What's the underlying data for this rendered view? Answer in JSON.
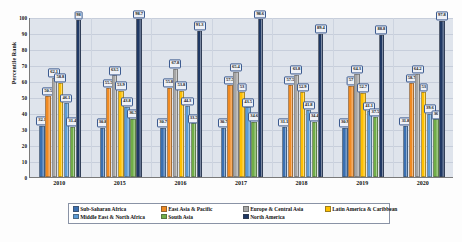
{
  "chart_data": {
    "type": "bar",
    "title": "",
    "xlabel": "",
    "ylabel": "Percentile Rank",
    "ylim": [
      0,
      100
    ],
    "ytick_values": [
      0,
      10,
      20,
      30,
      40,
      50,
      60,
      70,
      80,
      90,
      100
    ],
    "grid": true,
    "legend_position": "bottom",
    "categories": [
      "2010",
      "2015",
      "2016",
      "2017",
      "2018",
      "2019",
      "2020"
    ],
    "series": [
      {
        "name": "Sub-Saharan Africa",
        "color": "#3a6fb0",
        "values": [
          32.1,
          30.8,
          30.7,
          30.7,
          31.1,
          30.9,
          31.8
        ]
      },
      {
        "name": "East Asia & Pacific",
        "color": "#f08a22",
        "values": [
          50.5,
          55.5,
          55.8,
          57.5,
          57.5,
          57.0,
          58.7
        ]
      },
      {
        "name": "Europe & Central Asia",
        "color": "#a6a6a6",
        "values": [
          62.1,
          63.5,
          67.8,
          65.4,
          63.8,
          64.3,
          64.2
        ]
      },
      {
        "name": "Latin America & Caribbean",
        "color": "#ffc000",
        "values": [
          58.8,
          53.9,
          53.8,
          53.0,
          52.9,
          52.7,
          53.0
        ]
      },
      {
        "name": "Middle East & North Africa",
        "color": "#5b9bd5",
        "values": [
          46.1,
          43.8,
          44.3,
          43.5,
          41.8,
          41.1,
          39.6
        ]
      },
      {
        "name": "South Asia",
        "color": "#70ad47",
        "values": [
          31.4,
          36.5,
          33.5,
          34.6,
          34.4,
          37.5,
          36.0
        ]
      },
      {
        "name": "North America",
        "color": "#1f3864",
        "values": [
          98.0,
          98.7,
          91.3,
          98.6,
          89.4,
          88.8,
          97.8
        ]
      }
    ]
  }
}
